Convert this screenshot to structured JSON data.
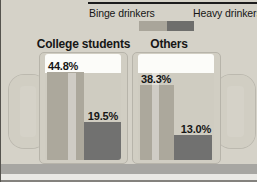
{
  "legend": {
    "items": [
      {
        "label": "Binge drinkers",
        "color": "#a9a59a"
      },
      {
        "label": "Heavy drinkers",
        "color": "#6e6e6c"
      }
    ]
  },
  "chart_data": {
    "type": "bar",
    "title": "",
    "categories": [
      "College students",
      "Others"
    ],
    "series": [
      {
        "name": "Binge drinkers",
        "values": [
          44.8,
          38.3
        ],
        "labels": [
          "44.8%",
          "38.3%"
        ],
        "color": "#aca89c"
      },
      {
        "name": "Heavy drinkers",
        "values": [
          19.5,
          13.0
        ],
        "labels": [
          "19.5%",
          "13.0%"
        ],
        "color": "#717170"
      }
    ],
    "unit": "percent",
    "ylim": [
      0,
      54.5
    ],
    "legend_position": "top"
  }
}
